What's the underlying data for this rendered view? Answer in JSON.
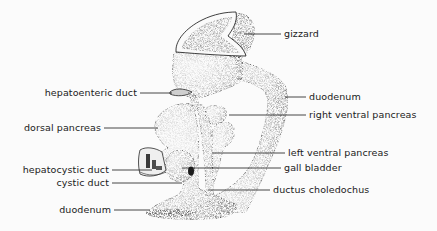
{
  "figure": {
    "labels_right": [
      {
        "id": "gizzard",
        "text": "gizzard",
        "x": 284,
        "y": 29,
        "line_from_x": 244,
        "line_to_x": 281,
        "line_y": 34
      },
      {
        "id": "duodenum-upper",
        "text": "duodenum",
        "x": 309,
        "y": 92,
        "line_from_x": 285,
        "line_to_x": 306,
        "line_y": 97
      },
      {
        "id": "right-ventral-pancreas",
        "text": "right ventral pancreas",
        "x": 309,
        "y": 110,
        "line_from_x": 229,
        "line_to_x": 306,
        "line_y": 115
      },
      {
        "id": "left-ventral-pancreas",
        "text": "left ventral pancreas",
        "x": 288,
        "y": 148,
        "line_from_x": 212,
        "line_to_x": 285,
        "line_y": 153
      },
      {
        "id": "gall-bladder",
        "text": "gall bladder",
        "x": 284,
        "y": 163,
        "line_from_x": 182,
        "line_to_x": 281,
        "line_y": 168
      },
      {
        "id": "ductus-choledochus",
        "text": "ductus choledochus",
        "x": 273,
        "y": 185,
        "line_from_x": 200,
        "line_to_x": 270,
        "line_y": 190
      }
    ],
    "labels_left": [
      {
        "id": "hepatoenteric-duct",
        "text": "hepatoenteric duct",
        "right": 301,
        "y": 88,
        "line_from_x": 140,
        "line_to_x": 170,
        "line_y": 93
      },
      {
        "id": "dorsal-pancreas",
        "text": "dorsal pancreas",
        "right": 335,
        "y": 122,
        "line_from_x": 104,
        "line_to_x": 155,
        "line_y": 128
      },
      {
        "id": "hepatocystic-duct",
        "text": "hepatocystic duct",
        "right": 327,
        "y": 165,
        "line_from_x": 112,
        "line_to_x": 152,
        "line_y": 170
      },
      {
        "id": "cystic-duct",
        "text": "cystic duct",
        "right": 327,
        "y": 178,
        "line_from_x": 112,
        "line_to_x": 180,
        "line_y": 183
      },
      {
        "id": "duodenum-lower",
        "text": "duodenum",
        "right": 325,
        "y": 205,
        "line_from_x": 114,
        "line_to_x": 150,
        "line_y": 210
      }
    ]
  },
  "colors": {
    "background": "#fbfbfb",
    "ink": "#1a1a1a",
    "stipple_dark": "#6a6a6a",
    "stipple_mid": "#a8a8a8",
    "stipple_light": "#d6d6d6"
  }
}
